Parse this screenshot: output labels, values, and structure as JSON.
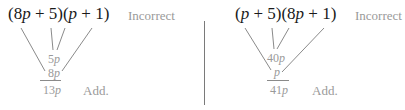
{
  "left_panel": {
    "expression": {
      "open1": "(",
      "coef1": "8",
      "var1": "p",
      "rest1": " + 5)(",
      "var2": "p",
      "rest2": " + 1)"
    },
    "status_label": "Incorrect",
    "inner_term": {
      "num": "5",
      "var": "p"
    },
    "outer_term": {
      "num": "8",
      "var": "p"
    },
    "sum_term": {
      "num": "13",
      "var": "p"
    },
    "action_label": "Add."
  },
  "right_panel": {
    "expression": {
      "open1": "(",
      "var1": "p",
      "rest1": " + 5)(8",
      "var2": "p",
      "rest2": " + 1)"
    },
    "status_label": "Incorrect",
    "inner_term": {
      "num": "40",
      "var": "p"
    },
    "outer_term": {
      "num": "",
      "var": "p"
    },
    "sum_term": {
      "num": "41",
      "var": "p"
    },
    "action_label": "Add."
  },
  "colors": {
    "expression_text": "#1a1a1a",
    "muted_text": "#9a9a9a",
    "connector_lines": "#8a8a8a",
    "divider": "#7a7a7a"
  }
}
